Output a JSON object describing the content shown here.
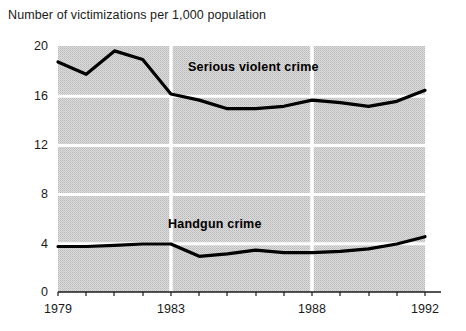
{
  "chart_data": {
    "type": "line",
    "title": "Number of victimizations per 1,000 population",
    "xlabel": "",
    "ylabel": "",
    "x": [
      1979,
      1980,
      1981,
      1982,
      1983,
      1984,
      1985,
      1986,
      1987,
      1988,
      1989,
      1990,
      1991,
      1992
    ],
    "xlim": [
      1979,
      1992
    ],
    "ylim": [
      0,
      20
    ],
    "yticks": [
      0,
      4,
      8,
      12,
      16,
      20
    ],
    "ytick_labels": [
      "0",
      "4",
      "8",
      "12",
      "16",
      "20"
    ],
    "xticks": [
      1979,
      1983,
      1988,
      1992
    ],
    "xtick_labels": [
      "1979",
      "1983",
      "1988",
      "1992"
    ],
    "grid": "white gridlines on gray halftone background; vertical gridlines at 1983 and 1988",
    "legend": "inline labels on plot",
    "series": [
      {
        "name": "Serious violent crime",
        "label_position": "upper-middle inline",
        "color": "#000000",
        "values": [
          18.7,
          17.7,
          19.6,
          18.9,
          16.1,
          15.6,
          14.9,
          14.9,
          15.1,
          15.6,
          15.4,
          15.1,
          15.5,
          16.4
        ]
      },
      {
        "name": "Handgun crime",
        "label_position": "lower-middle inline",
        "color": "#000000",
        "values": [
          3.7,
          3.7,
          3.8,
          3.9,
          3.9,
          2.9,
          3.1,
          3.4,
          3.2,
          3.2,
          3.3,
          3.5,
          3.9,
          4.5
        ]
      }
    ]
  },
  "ytick_labels": [
    "20",
    "16",
    "12",
    "8",
    "4",
    "0"
  ],
  "xtick_labels": [
    "1979",
    "1983",
    "1988",
    "1992"
  ],
  "series_labels": {
    "serious_violent_crime": "Serious violent crime",
    "handgun_crime": "Handgun crime"
  },
  "colors": {
    "line": "#000000",
    "plot_background": "#d2d2d2",
    "gridline": "#ffffff",
    "text": "#1a1a1a"
  }
}
